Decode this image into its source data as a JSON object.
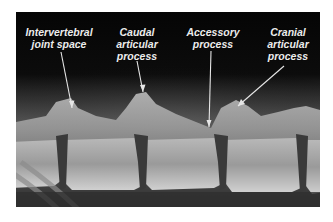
{
  "figure": {
    "type": "radiograph",
    "background_color": "#ffffff",
    "frame_color": "#0a0a0a",
    "label_color": "#ececec",
    "arrow_color": "#e6e6e6"
  },
  "labels": [
    {
      "id": "intervertebral",
      "text": "Intervertebral\njoint space",
      "x": 4,
      "y": 14,
      "w": 78,
      "arrow": {
        "x1": 45,
        "y1": 40,
        "x2": 56,
        "y2": 96
      }
    },
    {
      "id": "caudal",
      "text": "Caudal\narticular\nprocess",
      "x": 92,
      "y": 14,
      "w": 58,
      "arrow": {
        "x1": 121,
        "y1": 49,
        "x2": 127,
        "y2": 80
      }
    },
    {
      "id": "accessory",
      "text": "Accessory\nprocess",
      "x": 164,
      "y": 14,
      "w": 66,
      "arrow": {
        "x1": 195,
        "y1": 39,
        "x2": 193,
        "y2": 115
      }
    },
    {
      "id": "cranial",
      "text": "Cranial\narticular\nprocess",
      "x": 244,
      "y": 14,
      "w": 56,
      "arrow": {
        "x1": 268,
        "y1": 54,
        "x2": 222,
        "y2": 94
      }
    }
  ]
}
